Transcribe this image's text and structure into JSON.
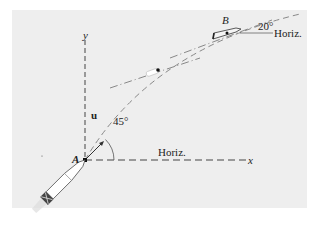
{
  "diagram": {
    "labels": {
      "y_axis": "y",
      "x_axis": "x",
      "point_a": "A",
      "point_b": "B",
      "unit_vector": "u",
      "angle_a": "45°",
      "horiz_a": "Horiz.",
      "angle_b": "20°",
      "horiz_b": "Horiz."
    },
    "colors": {
      "background": "#eeeeee",
      "line": "#333333",
      "trajectory": "#888888"
    }
  }
}
